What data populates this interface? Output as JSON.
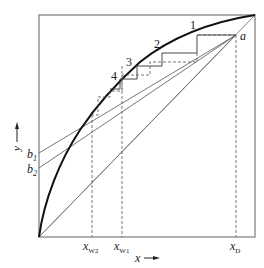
{
  "diagram": {
    "type": "McCabe-Thiele distillation diagram",
    "axes": {
      "x_label": "x",
      "y_label": "y",
      "x_arrow": "→",
      "y_arrow": "↑"
    },
    "points": {
      "a": "a",
      "b1": "b",
      "b1_sub": "1",
      "b2": "b",
      "b2_sub": "2"
    },
    "x_ticks": [
      {
        "main": "x",
        "sub": "W2"
      },
      {
        "main": "x",
        "sub": "W1"
      },
      {
        "main": "x",
        "sub": "D"
      }
    ],
    "stage_labels": [
      "1",
      "2",
      "3",
      "4"
    ],
    "colors": {
      "frame": "#7a7a7a",
      "curve": "#111111",
      "thin_line": "#6a6a6a",
      "dashed": "#555555"
    }
  }
}
